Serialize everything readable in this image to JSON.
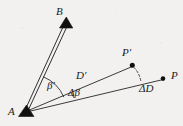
{
  "figure": {
    "type": "geometry-diagram",
    "background_color": "#f2f1ef",
    "ink_color": "#1a1a1a",
    "labels": {
      "point_A": "A",
      "point_B": "B",
      "point_P": "P",
      "point_P_prime": "P′",
      "angle_beta_prime": "β′",
      "angle_delta_beta": "Δβ",
      "segment_D_prime": "D′",
      "segment_delta_D": "ΔD"
    },
    "markers": [
      {
        "name": "station-A",
        "glyph": "filled-triangle",
        "x": 26,
        "y": 111
      },
      {
        "name": "station-B",
        "glyph": "filled-triangle",
        "x": 66,
        "y": 22
      },
      {
        "name": "point-P-prime",
        "glyph": "filled-dot",
        "x": 132,
        "y": 65
      },
      {
        "name": "point-P",
        "glyph": "filled-dot",
        "x": 163,
        "y": 79
      }
    ],
    "lines": [
      {
        "name": "ray-A-to-B",
        "style": "double-solid",
        "from": [
          26,
          111
        ],
        "to": [
          66,
          25
        ]
      },
      {
        "name": "ray-A-to-P-prime",
        "style": "solid",
        "from": [
          26,
          111
        ],
        "to": [
          133,
          66
        ]
      },
      {
        "name": "ray-A-to-P",
        "style": "solid",
        "from": [
          26,
          111
        ],
        "to": [
          164,
          79
        ]
      },
      {
        "name": "arc-P-prime-to-AP",
        "style": "dashed-arc",
        "from": [
          133,
          67
        ],
        "to": [
          141,
          82
        ]
      }
    ],
    "arcs": [
      {
        "name": "arc-beta-prime",
        "between": [
          "ray-A-to-B",
          "ray-A-to-P-prime"
        ],
        "radius": 38
      },
      {
        "name": "arc-delta-beta",
        "between": [
          "ray-A-to-P-prime",
          "ray-A-to-P"
        ],
        "radius": 48
      }
    ]
  }
}
